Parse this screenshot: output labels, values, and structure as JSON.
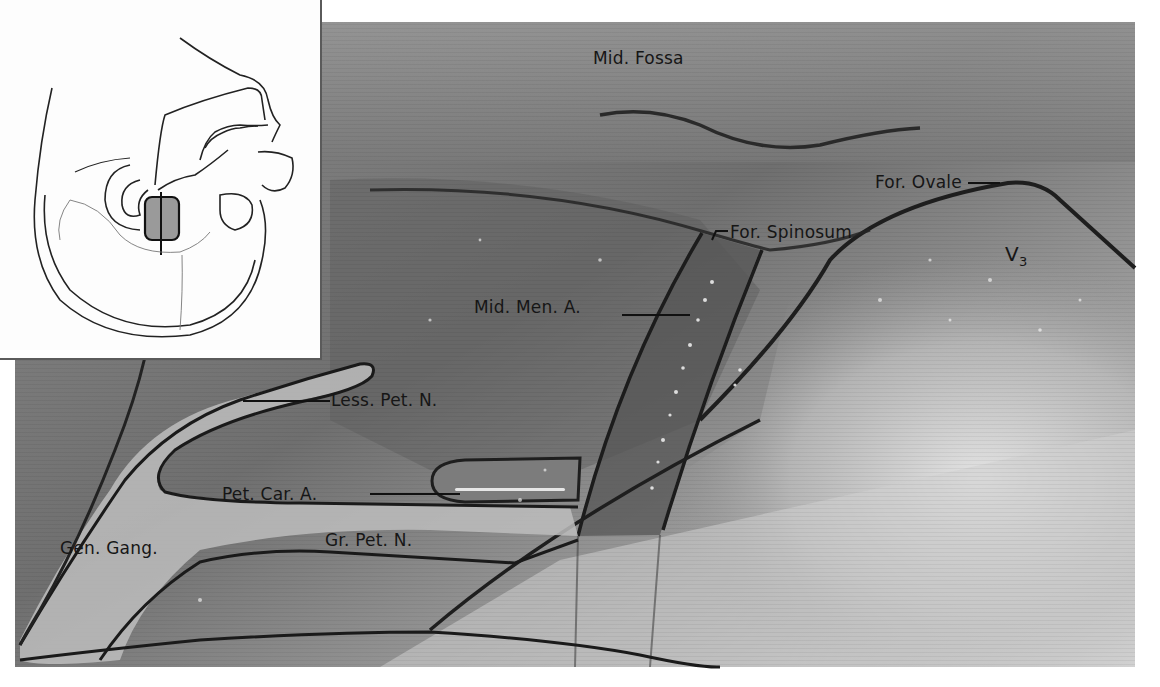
{
  "figure": {
    "type": "anatomical-photo-with-labels",
    "region": "middle cranial fossa, extradural view",
    "inset": {
      "description": "line drawing of skull base with shaded rectangular exposure area"
    },
    "labels": {
      "mid_fossa": "Mid. Fossa",
      "for_ovale": "For. Ovale",
      "for_spinosum": "For. Spinosum",
      "v3_main": "V",
      "v3_sub": "3",
      "mid_men_a": "Mid. Men. A.",
      "less_pet_n": "Less. Pet. N.",
      "pet_car_a": "Pet. Car. A.",
      "gen_gang": "Gen. Gang.",
      "gr_pet_n": "Gr. Pet. N."
    },
    "colors": {
      "photo_dark": "#6b6b6b",
      "photo_mid": "#8e8e8e",
      "photo_light": "#c8c8c8",
      "outline": "#1e1e1e",
      "label_text": "#161616"
    }
  }
}
